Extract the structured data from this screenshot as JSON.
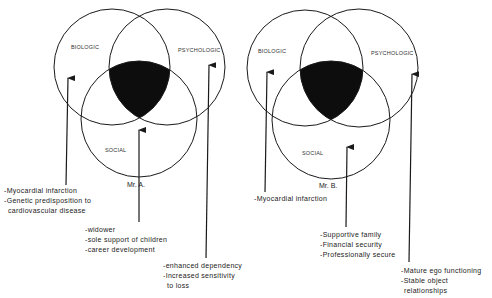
{
  "diagrams": [
    {
      "patient": "Mr. A.",
      "circles": {
        "biologic": "BIOLOGIC",
        "psychologic": "PSYCHOLOGIC",
        "social": "SOCIAL"
      },
      "biologic_factors": [
        "-Myocardial infarction",
        "-Genetic predisposition to",
        "cardiovascular disease"
      ],
      "social_factors": [
        "-widower",
        "-sole support of children",
        "-career development"
      ],
      "psychologic_factors": [
        "-enhanced dependency",
        "-Increased sensitivity",
        "to loss"
      ]
    },
    {
      "patient": "Mr. B.",
      "circles": {
        "biologic": "BIOLOGIC",
        "psychologic": "PSYCHOLOGIC",
        "social": "SOCIAL"
      },
      "biologic_factors": [
        "-Myocardial infarction"
      ],
      "social_factors": [
        "-Supportive family",
        "-Financial security",
        "-Professionally secure"
      ],
      "psychologic_factors": [
        "-Mature ego functioning",
        "-Stable object",
        "relationships"
      ]
    }
  ],
  "colors": {
    "line": "#1a1a1a",
    "fill": "#0d0d0d",
    "background": "#ffffff"
  }
}
